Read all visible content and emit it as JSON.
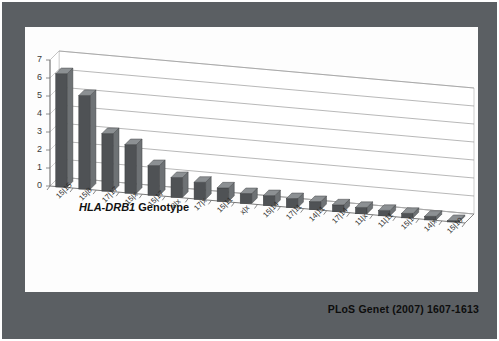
{
  "slide": {
    "citation": "PLoS Genet (2007) 1607-1613",
    "frame_color": "#5b5f63",
    "panel_color": "#fdfdfd"
  },
  "axis_title": {
    "italic_part": "HLA-DRB1",
    "plain_part": " Genotype"
  },
  "chart_data": {
    "type": "bar",
    "title": "",
    "subtitle": "",
    "xlabel": "HLA-DRB1 Genotype",
    "ylabel": "",
    "ylim": [
      0,
      7
    ],
    "yticks": [
      0,
      1,
      2,
      3,
      4,
      5,
      6,
      7
    ],
    "ytick_labels": [
      "0",
      "1",
      "2",
      "3",
      "4",
      "5",
      "6",
      "7"
    ],
    "grid": true,
    "legend": "none",
    "three_d": true,
    "bar_color": "#4f5255",
    "bar_side_color": "#6e7275",
    "bar_top_color": "#8c9093",
    "categories": [
      "15|15",
      "15|8",
      "17|17",
      "15|x",
      "15|17",
      "8|x",
      "17|x",
      "15|11",
      "x|x",
      "15|14",
      "17|11",
      "14|11",
      "17|14",
      "11|x",
      "11|11",
      "15|1",
      "14|x",
      "15|10"
    ],
    "values": [
      6.3,
      5.2,
      3.2,
      2.7,
      1.65,
      1.1,
      0.95,
      0.75,
      0.55,
      0.55,
      0.5,
      0.45,
      0.38,
      0.35,
      0.3,
      0.25,
      0.2,
      0.08
    ]
  }
}
